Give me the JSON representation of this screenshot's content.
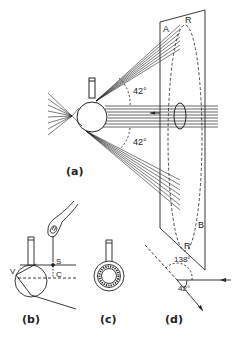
{
  "figure": {
    "panels": [
      {
        "id": "a",
        "label": "(a)"
      },
      {
        "id": "b",
        "label": "(b)"
      },
      {
        "id": "c",
        "label": "(c)"
      },
      {
        "id": "d",
        "label": "(d)"
      }
    ],
    "panel_a": {
      "angle_upper": "42°",
      "angle_lower": "42°",
      "plane_corner_top": "A",
      "plane_corner_bottom": "B",
      "ring_label_top": "R",
      "ring_label_bottom": "R"
    },
    "panel_b": {
      "label_s": "S",
      "label_c": "C",
      "label_v": "V"
    },
    "panel_d": {
      "angle_large": "138°",
      "angle_small": "42°"
    },
    "colors": {
      "ink": "#222222",
      "background": "#ffffff"
    }
  }
}
